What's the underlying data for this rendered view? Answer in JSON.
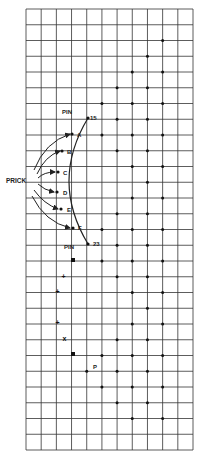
{
  "grid": {
    "left": 26,
    "top": 9,
    "right": 193,
    "bottom": 450,
    "cols": 11,
    "rows": 28,
    "line_color": "#333333"
  },
  "labels": {
    "prick": "PRICK",
    "pin_top": "PIN",
    "pin_top_number": "15",
    "pin_bottom": "PIN",
    "pin_bottom_number": "23",
    "points": [
      "A",
      "B",
      "C",
      "D",
      "E",
      "F"
    ],
    "p_label": "P"
  },
  "arc_points": [
    {
      "name": "PIN15",
      "x": 88,
      "y": 118
    },
    {
      "name": "A",
      "x": 72,
      "y": 134
    },
    {
      "name": "B",
      "x": 62,
      "y": 151
    },
    {
      "name": "C",
      "x": 58,
      "y": 172
    },
    {
      "name": "D",
      "x": 57,
      "y": 192
    },
    {
      "name": "E",
      "x": 61,
      "y": 209
    },
    {
      "name": "F",
      "x": 73,
      "y": 228
    },
    {
      "name": "PIN23",
      "x": 88,
      "y": 244
    }
  ],
  "dots": [
    [
      2,
      9
    ],
    [
      3,
      8
    ],
    [
      4,
      7
    ],
    [
      4,
      9
    ],
    [
      5,
      6
    ],
    [
      5,
      8
    ],
    [
      6,
      5
    ],
    [
      6,
      7
    ],
    [
      6,
      9
    ],
    [
      7,
      6
    ],
    [
      7,
      8
    ],
    [
      8,
      5
    ],
    [
      8,
      7
    ],
    [
      8,
      9
    ],
    [
      9,
      6
    ],
    [
      9,
      8
    ],
    [
      10,
      7
    ],
    [
      10,
      9
    ],
    [
      11,
      8
    ],
    [
      12,
      7
    ],
    [
      12,
      9
    ],
    [
      13,
      6
    ],
    [
      13,
      8
    ],
    [
      14,
      5
    ],
    [
      14,
      7
    ],
    [
      14,
      9
    ],
    [
      15,
      6
    ],
    [
      15,
      8
    ],
    [
      16,
      5
    ],
    [
      16,
      7
    ],
    [
      16,
      9
    ],
    [
      17,
      6
    ],
    [
      17,
      8
    ],
    [
      18,
      7
    ],
    [
      18,
      9
    ],
    [
      19,
      8
    ],
    [
      20,
      7
    ],
    [
      20,
      9
    ],
    [
      21,
      6
    ],
    [
      21,
      8
    ],
    [
      22,
      5
    ],
    [
      22,
      7
    ],
    [
      22,
      9
    ],
    [
      23,
      4
    ],
    [
      23,
      6
    ],
    [
      23,
      8
    ],
    [
      24,
      5
    ],
    [
      24,
      7
    ],
    [
      24,
      9
    ],
    [
      25,
      6
    ],
    [
      25,
      8
    ],
    [
      26,
      7
    ],
    [
      26,
      9
    ]
  ],
  "lower_marks": [
    {
      "type": "square",
      "x": 73,
      "y": 260
    },
    {
      "type": "plus",
      "x": 64,
      "y": 276
    },
    {
      "type": "plus",
      "x": 58,
      "y": 291
    },
    {
      "type": "plus",
      "x": 58,
      "y": 322
    },
    {
      "type": "x",
      "x": 65,
      "y": 338
    },
    {
      "type": "square",
      "x": 73,
      "y": 354
    }
  ]
}
